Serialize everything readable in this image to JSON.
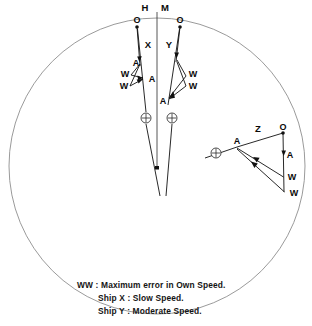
{
  "figure": {
    "title_marks": {
      "heading_marker": "H",
      "mean_marker": "M"
    },
    "outer_circle": {
      "cx": 157,
      "cy": 166,
      "r": 148,
      "color": "#8e8e8e"
    },
    "groups": [
      {
        "id": "ship-x",
        "ship_label": "X",
        "ship_label_pos": {
          "x": 148,
          "y": 45
        },
        "own_ship_origin_label": "O",
        "own_ship_origin_pos": {
          "x": 137,
          "y": 23
        },
        "points": [
          {
            "label": "A",
            "x": 139,
            "y": 62
          },
          {
            "label": "A",
            "x": 150,
            "y": 80
          },
          {
            "label": "W",
            "x": 125,
            "y": 73
          },
          {
            "label": "W",
            "x": 124,
            "y": 85
          }
        ],
        "ship_symbol": {
          "x": 146,
          "y": 118
        }
      },
      {
        "id": "ship-y",
        "ship_label": "Y",
        "ship_label_pos": {
          "x": 169,
          "y": 45
        },
        "own_ship_origin_label": "O",
        "own_ship_origin_pos": {
          "x": 180,
          "y": 23
        },
        "points": [
          {
            "label": "W",
            "x": 192,
            "y": 73
          },
          {
            "label": "W",
            "x": 192,
            "y": 85
          },
          {
            "label": "A",
            "x": 165,
            "y": 101
          }
        ],
        "ship_symbol": {
          "x": 172,
          "y": 118
        }
      },
      {
        "id": "ship-z",
        "ship_label": "Z",
        "ship_label_pos": {
          "x": 258,
          "y": 129
        },
        "own_ship_origin_label": "O",
        "own_ship_origin_pos": {
          "x": 282,
          "y": 128
        },
        "points": [
          {
            "label": "A",
            "x": 237,
            "y": 142
          },
          {
            "label": "A",
            "x": 285,
            "y": 155
          },
          {
            "label": "W",
            "x": 289,
            "y": 175
          },
          {
            "label": "W",
            "x": 291,
            "y": 191
          }
        ],
        "ship_symbol": {
          "x": 216,
          "y": 153
        }
      }
    ]
  },
  "legend": {
    "lines": [
      "WW  : Maximum error in Own  Speed.",
      "Ship X : Slow  Speed.",
      "Ship Y : Moderate Speed."
    ]
  }
}
